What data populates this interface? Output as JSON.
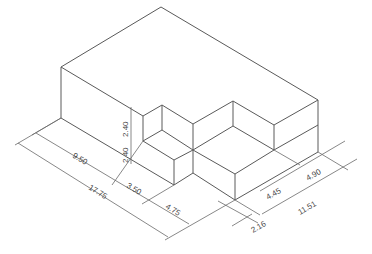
{
  "drawing": {
    "title": "Isometric stepped block with dimensions",
    "line_color": "#5a5a5a",
    "background": "#ffffff"
  },
  "dimensions": {
    "d_950": "9.50",
    "d_1775": "17.75",
    "d_350": "3.50",
    "d_475": "4.75",
    "d_240_upper": "2.40",
    "d_240_lower": "2.40",
    "d_445": "4.45",
    "d_490": "4.90",
    "d_1151": "11.51",
    "d_216": "2.16"
  }
}
